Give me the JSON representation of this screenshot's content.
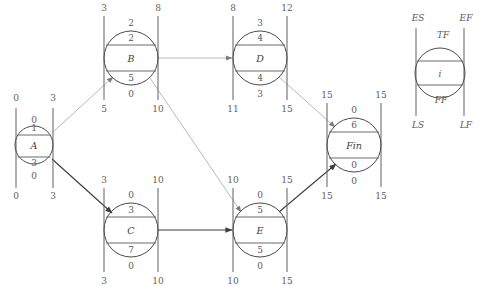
{
  "diagram": {
    "colors": {
      "node_stroke": "#4a4a4a",
      "text": "#5a5a5a",
      "bar": "#6d6d6d",
      "edge_dark": "#3b3b3b",
      "edge_light": "#b9b9b9"
    }
  },
  "legend": {
    "es": "ES",
    "ef": "EF",
    "tf": "TF",
    "id": "i",
    "ff": "FF",
    "ls": "LS",
    "lf": "LF"
  },
  "nodes": [
    {
      "key": "A",
      "name": "A",
      "es": "0",
      "ef": "3",
      "ls": "0",
      "lf": "3",
      "tf": "0",
      "ff": "0",
      "top_inner": "1",
      "bottom_inner": "3",
      "cx": 34,
      "cy": 145,
      "r": 19
    },
    {
      "key": "B",
      "name": "B",
      "es": "3",
      "ef": "8",
      "ls": "5",
      "lf": "10",
      "tf": "2",
      "ff": "0",
      "top_inner": "2",
      "bottom_inner": "5",
      "cx": 131,
      "cy": 58,
      "r": 27
    },
    {
      "key": "D",
      "name": "D",
      "es": "8",
      "ef": "12",
      "ls": "11",
      "lf": "15",
      "tf": "3",
      "ff": "3",
      "top_inner": "4",
      "bottom_inner": "4",
      "cx": 260,
      "cy": 58,
      "r": 27
    },
    {
      "key": "C",
      "name": "C",
      "es": "3",
      "ef": "10",
      "ls": "3",
      "lf": "10",
      "tf": "0",
      "ff": "0",
      "top_inner": "3",
      "bottom_inner": "7",
      "cx": 131,
      "cy": 230,
      "r": 27
    },
    {
      "key": "E",
      "name": "E",
      "es": "10",
      "ef": "15",
      "ls": "10",
      "lf": "15",
      "tf": "0",
      "ff": "0",
      "top_inner": "5",
      "bottom_inner": "5",
      "cx": 260,
      "cy": 230,
      "r": 27
    },
    {
      "key": "Fin",
      "name": "Fin",
      "es": "15",
      "ef": "15",
      "ls": "15",
      "lf": "15",
      "tf": "0",
      "ff": "0",
      "top_inner": "6",
      "bottom_inner": "0",
      "cx": 354,
      "cy": 145,
      "r": 27
    }
  ],
  "edges": [
    {
      "from": "A",
      "to": "B",
      "style": "light"
    },
    {
      "from": "A",
      "to": "C",
      "style": "dark"
    },
    {
      "from": "B",
      "to": "D",
      "style": "light"
    },
    {
      "from": "B",
      "to": "E",
      "style": "light"
    },
    {
      "from": "C",
      "to": "E",
      "style": "dark"
    },
    {
      "from": "D",
      "to": "Fin",
      "style": "light"
    },
    {
      "from": "E",
      "to": "Fin",
      "style": "dark"
    }
  ]
}
